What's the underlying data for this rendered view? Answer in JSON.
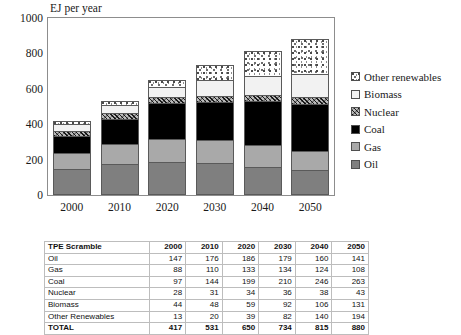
{
  "chart_data": {
    "type": "bar",
    "subtype": "stacked-bar",
    "title": "EJ per year",
    "xlabel": "",
    "ylabel": "",
    "ylim": [
      0,
      1000
    ],
    "yticks": [
      0,
      200,
      400,
      600,
      800,
      1000
    ],
    "grid": false,
    "legend_position": "right",
    "categories": [
      "2000",
      "2010",
      "2020",
      "2030",
      "2040",
      "2050"
    ],
    "series": [
      {
        "name": "Oil",
        "values": [
          147,
          176,
          186,
          179,
          160,
          141
        ]
      },
      {
        "name": "Gas",
        "values": [
          88,
          110,
          133,
          134,
          124,
          108
        ]
      },
      {
        "name": "Coal",
        "values": [
          97,
          144,
          199,
          210,
          246,
          263
        ]
      },
      {
        "name": "Nuclear",
        "values": [
          28,
          31,
          34,
          36,
          38,
          43
        ]
      },
      {
        "name": "Biomass",
        "values": [
          44,
          48,
          59,
          92,
          106,
          131
        ]
      },
      {
        "name": "Other Renewables",
        "values": [
          13,
          20,
          39,
          82,
          140,
          194
        ]
      }
    ],
    "totals": [
      417,
      531,
      650,
      734,
      815,
      880
    ]
  },
  "legend": {
    "items": [
      {
        "label": "Other renewables",
        "swatch": "speckled",
        "color": "#ffffff"
      },
      {
        "label": "Biomass",
        "swatch": "solid",
        "color": "#f2f2f2"
      },
      {
        "label": "Nuclear",
        "swatch": "hatched",
        "color": "#b9b9b9"
      },
      {
        "label": "Coal",
        "swatch": "solid",
        "color": "#000000"
      },
      {
        "label": "Gas",
        "swatch": "solid",
        "color": "#a9a9a9"
      },
      {
        "label": "Oil",
        "swatch": "solid",
        "color": "#7f7f7f"
      }
    ]
  },
  "axis": {
    "yticks": [
      "1000",
      "800",
      "600",
      "400",
      "200",
      "0"
    ],
    "xticks": [
      "2000",
      "2010",
      "2020",
      "2030",
      "2040",
      "2050"
    ]
  },
  "table": {
    "corner_label": "TPE Scramble",
    "columns": [
      "2000",
      "2010",
      "2020",
      "2030",
      "2040",
      "2050"
    ],
    "rows": [
      {
        "label": "Oil",
        "values": [
          "147",
          "176",
          "186",
          "179",
          "160",
          "141"
        ]
      },
      {
        "label": "Gas",
        "values": [
          "88",
          "110",
          "133",
          "134",
          "124",
          "108"
        ]
      },
      {
        "label": "Coal",
        "values": [
          "97",
          "144",
          "199",
          "210",
          "246",
          "263"
        ]
      },
      {
        "label": "Nuclear",
        "values": [
          "28",
          "31",
          "34",
          "36",
          "38",
          "43"
        ]
      },
      {
        "label": "Biomass",
        "values": [
          "44",
          "48",
          "59",
          "92",
          "106",
          "131"
        ]
      },
      {
        "label": "Other Renewables",
        "values": [
          "13",
          "20",
          "39",
          "82",
          "140",
          "194"
        ]
      }
    ],
    "total": {
      "label": "TOTAL",
      "values": [
        "417",
        "531",
        "650",
        "734",
        "815",
        "880"
      ]
    }
  }
}
